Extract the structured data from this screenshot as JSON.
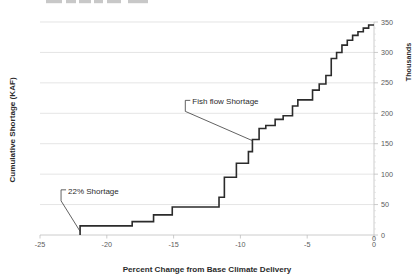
{
  "chart_data": {
    "type": "line",
    "title": "",
    "xlabel": "Percent Change from Base Climate Delivery",
    "ylabel": "Cumulative Shortage (KAF)",
    "y2label": "Thousands",
    "xlim": [
      -25,
      0
    ],
    "ylim": [
      0,
      350
    ],
    "xticks": [
      -25,
      -20,
      -15,
      -10,
      -5,
      0
    ],
    "xticklabels": [
      "-25",
      "-20",
      "-15",
      "-10",
      "-5",
      "0"
    ],
    "yticks": [
      0,
      50,
      100,
      150,
      200,
      250,
      300,
      350
    ],
    "yticklabels": [
      "0",
      "50",
      "100",
      "150",
      "200",
      "250",
      "300",
      "350"
    ],
    "grid": true,
    "grid_axis": "y",
    "legend": "none",
    "series": [
      {
        "name": "Cumulative Shortage",
        "step": "post",
        "color": "#2b2b2b",
        "x": [
          -22.0,
          -22.0,
          -18.1,
          -18.1,
          -16.5,
          -16.5,
          -15.1,
          -15.1,
          -11.6,
          -11.6,
          -11.2,
          -11.2,
          -10.3,
          -10.3,
          -9.4,
          -9.4,
          -9.1,
          -9.1,
          -8.6,
          -8.6,
          -8.1,
          -8.1,
          -7.4,
          -7.4,
          -6.8,
          -6.8,
          -6.1,
          -6.1,
          -5.7,
          -5.7,
          -4.6,
          -4.6,
          -4.1,
          -4.1,
          -3.6,
          -3.6,
          -3.2,
          -3.2,
          -2.8,
          -2.8,
          -2.4,
          -2.4,
          -2.0,
          -2.0,
          -1.6,
          -1.6,
          -1.2,
          -1.2,
          -0.8,
          -0.8,
          -0.4,
          -0.4,
          0.0
        ],
        "y": [
          0,
          15,
          15,
          22,
          22,
          33,
          33,
          46,
          46,
          62,
          62,
          95,
          95,
          118,
          118,
          137,
          137,
          157,
          157,
          175,
          175,
          180,
          180,
          190,
          190,
          196,
          196,
          212,
          212,
          222,
          222,
          238,
          238,
          248,
          248,
          262,
          262,
          290,
          290,
          300,
          300,
          312,
          312,
          320,
          320,
          328,
          328,
          334,
          334,
          340,
          340,
          345,
          345
        ]
      }
    ],
    "annotations": [
      {
        "name": "22% Shortage",
        "label": "22% Shortage",
        "text_x": -22.9,
        "text_y": 66,
        "point_x": -22.0,
        "point_y": 6
      },
      {
        "name": "Fish flow Shortage",
        "label": "Fish flow Shortage",
        "text_x": -13.6,
        "text_y": 213,
        "point_x": -9.1,
        "point_y": 155
      }
    ]
  },
  "axes": {
    "x_title": "Percent Change from Base Climate Delivery",
    "y_title": "Cumulative Shortage (KAF)",
    "y2_title": "Thousands",
    "x_tick_labels": [
      "-25",
      "-20",
      "-15",
      "-10",
      "-5",
      "0"
    ],
    "y2_tick_labels": [
      "0",
      "50",
      "100",
      "150",
      "200",
      "250",
      "300",
      "350"
    ],
    "x_origin_label": "0"
  },
  "annotations": {
    "shortage_22": "22% Shortage",
    "fish_flow": "Fish flow Shortage"
  },
  "title": {
    "text": ""
  }
}
